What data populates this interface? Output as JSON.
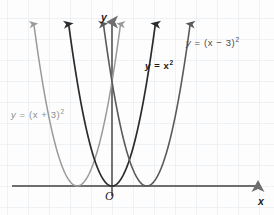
{
  "figure": {
    "background_color": "#fdfdfd",
    "grid_color": "#dde3ea",
    "axis_color": "#6e6e6e"
  },
  "axes": {
    "x_axis_label": "x",
    "y_axis_label": "y",
    "origin_label": "O",
    "origin_px": {
      "x": 112,
      "y": 186
    },
    "grid_spacing_px": 21,
    "unit_px": 11.6
  },
  "curves": [
    {
      "id": "shift-left",
      "label_lead": "y",
      "label_body": "= (x + 3)",
      "label_exponent": "2",
      "label_full": "y = (x + 3)²",
      "color": "#9a9a9a",
      "stroke_width": 1.5,
      "vertex": {
        "x": -3,
        "y": 0
      },
      "vertex_px": {
        "x": 78,
        "y": 186
      },
      "equation": "y = (x + 3)^2"
    },
    {
      "id": "base",
      "label_lead": "y",
      "label_body": "= x",
      "label_exponent": "2",
      "label_full": "y = x²",
      "color": "#2b2b2b",
      "stroke_width": 1.7,
      "vertex": {
        "x": 0,
        "y": 0
      },
      "vertex_px": {
        "x": 112,
        "y": 186
      },
      "equation": "y = x^2"
    },
    {
      "id": "shift-right",
      "label_lead": "y",
      "label_body": "= (x − 3)",
      "label_exponent": "2",
      "label_full": "y = (x − 3)²",
      "color": "#5a5a5a",
      "stroke_width": 1.6,
      "vertex": {
        "x": 3,
        "y": 0
      },
      "vertex_px": {
        "x": 147,
        "y": 186
      },
      "equation": "y = (x - 3)^2"
    }
  ],
  "chart_data": {
    "type": "line",
    "title": "",
    "subtitle": "",
    "xlabel": "x",
    "ylabel": "y",
    "xlim": [
      -9.7,
      13.8
    ],
    "ylim": [
      -2.5,
      15.0
    ],
    "grid": true,
    "grid_spacing_units": 1.8,
    "legend": "inline-annotations",
    "annotations": [
      {
        "text": "y = (x + 3)²",
        "anchor_px": {
          "x": 11,
          "y": 110
        },
        "color": "#8d8d8d"
      },
      {
        "text": "y = x²",
        "anchor_px": {
          "x": 145,
          "y": 61
        },
        "color": "#1c1c1c"
      },
      {
        "text": "y = (x − 3)²",
        "anchor_px": {
          "x": 186,
          "y": 38
        },
        "color": "#4a4a4a"
      },
      {
        "text": "O",
        "anchor_px": {
          "x": 105,
          "y": 190
        },
        "color": "#1c1c1c"
      }
    ],
    "series": [
      {
        "name": "y = (x + 3)²",
        "color": "#9a9a9a",
        "vertex": [
          -3,
          0
        ],
        "x": [
          -7.0,
          -6.0,
          -5.0,
          -4.0,
          -3.0,
          -2.0,
          -1.0,
          0.0,
          1.0
        ],
        "values": [
          16.0,
          9.0,
          4.0,
          1.0,
          0.0,
          1.0,
          4.0,
          9.0,
          16.0
        ]
      },
      {
        "name": "y = x²",
        "color": "#2b2b2b",
        "vertex": [
          0,
          0
        ],
        "x": [
          -4.0,
          -3.0,
          -2.0,
          -1.0,
          0.0,
          1.0,
          2.0,
          3.0,
          4.0
        ],
        "values": [
          16.0,
          9.0,
          4.0,
          1.0,
          0.0,
          1.0,
          4.0,
          9.0,
          16.0
        ]
      },
      {
        "name": "y = (x − 3)²",
        "color": "#5a5a5a",
        "vertex": [
          3,
          0
        ],
        "x": [
          -1.0,
          0.0,
          1.0,
          2.0,
          3.0,
          4.0,
          5.0,
          6.0,
          7.0
        ],
        "values": [
          16.0,
          9.0,
          4.0,
          1.0,
          0.0,
          1.0,
          4.0,
          9.0,
          16.0
        ]
      }
    ]
  }
}
